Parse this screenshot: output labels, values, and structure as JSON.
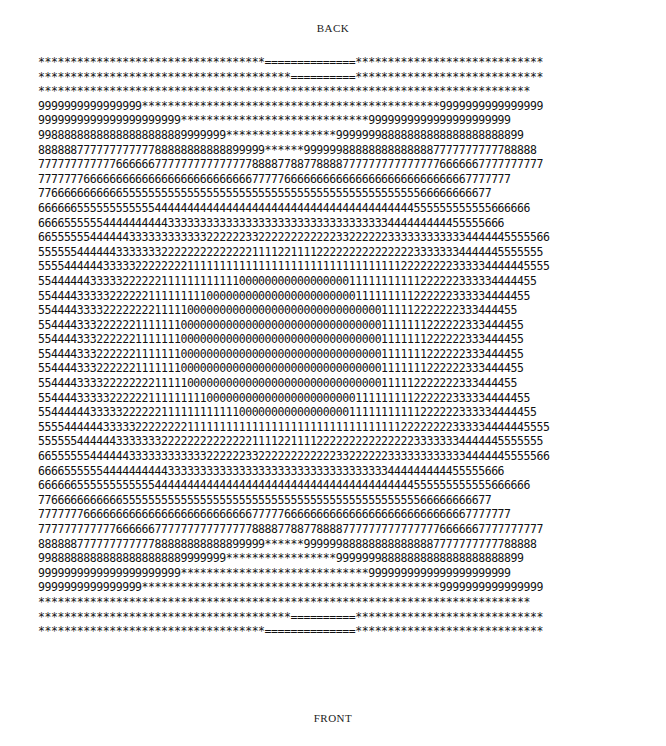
{
  "labels": {
    "top": "BACK",
    "bottom": "FRONT"
  },
  "chart_data": {
    "type": "heatmap",
    "title": "",
    "xlabel": "",
    "ylabel": "",
    "top_label": "BACK",
    "bottom_label": "FRONT",
    "legend": "Character-coded contour levels 0-9; '*' above level 9; '=' highest band",
    "rows": [
      "***********************************==============*****************************",
      "***************************************==========*****************************",
      "****************************************************************************",
      "9999999999999999**********************************************9999999999999999",
      "9999999999999999999999*****************************9999999999999999999999",
      "99888888888888888888889999999*****************99999998888888888888888888899",
      "88888877777777777788888888888899999******999999888888888888887777777777788888",
      "777777777777666666777777777777777888877887788887777777777777776666667777777777",
      "7777777666666666666666666666666667777766666666666666666666666666667777777",
      "7766666666666555555555555555555555555555555555555555555555566666666677",
      "6666665555555555554444444444444444444444444444444444444444555555555555666666",
      "666655555544444444443333333333333333333333333333333333444444444455555666",
      "6655555544444433333333333322222233222222222222332222223333333333334444445555566",
      "555555444444333333322222222222222111122111122222222222222233333334444445555555",
      "5555444444333332222222211111111111111111111111111111111122222222333334444445555",
      "55444444333332222221111111111110000000000000000011111111111222222333334444455",
      "5544443333322222211111111100000000000000000000000111111111222222333334444455",
      "55444433332222222211111000000000000000000000000000000111112222222333444455",
      "554444333222222111111100000000000000000000000000000001111111222222333444455",
      "554444333222222111111100000000000000000000000000000001111111222222333444455",
      "554444333222222111111100000000000000000000000000000001111111222222333444455",
      "554444333222222111111100000000000000000000000000000001111111222222333444455",
      "55444433332222222211111000000000000000000000000000000111112222222333444455",
      "5544443333322222211111111100000000000000000000000111111111222222333334444455",
      "55444444333332222221111111111110000000000000000011111111111222222333334444455",
      "5555444444333332222222211111111111111111111111111111111122222222333334444445555",
      "555555444444333333322222222222222111122111122222222222222233333334444445555555",
      "6655555544444433333333333322222233222222222222332222223333333333334444445555566",
      "666655555544444444443333333333333333333333333333333333444444444455555666",
      "6666665555555555554444444444444444444444444444444444444444555555555555666666",
      "7766666666666555555555555555555555555555555555555555555555566666666677",
      "7777777666666666666666666666666667777766666666666666666666666666667777777",
      "777777777777666666777777777777777888877887788887777777777777776666667777777777",
      "88888877777777777788888888888899999******999999888888888888887777777777788888",
      "99888888888888888888889999999*****************99999998888888888888888888899",
      "9999999999999999999999*****************************9999999999999999999999",
      "9999999999999999**********************************************9999999999999999",
      "****************************************************************************",
      "***************************************==========*****************************",
      "***********************************==============*****************************"
    ],
    "levels": [
      "0",
      "1",
      "2",
      "3",
      "4",
      "5",
      "6",
      "7",
      "8",
      "9",
      "*",
      "="
    ],
    "symmetry": "vertical (top-bottom mirror), horizontal (left-right mirror)"
  }
}
